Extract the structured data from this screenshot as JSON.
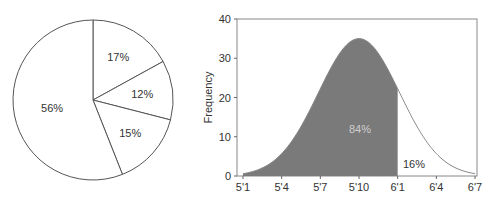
{
  "chart_data": [
    {
      "type": "pie",
      "title": "",
      "slices": [
        {
          "label": "17%",
          "value": 17
        },
        {
          "label": "12%",
          "value": 12
        },
        {
          "label": "15%",
          "value": 15
        },
        {
          "label": "56%",
          "value": 56
        }
      ],
      "colors": [
        "#ffffff"
      ],
      "stroke": "#555555"
    },
    {
      "type": "area",
      "title": "",
      "xlabel": "",
      "ylabel": "Frequency",
      "x_ticks": [
        "5'1",
        "5'4",
        "5'7",
        "5'10",
        "6'1",
        "6'4",
        "6'7"
      ],
      "y_ticks": [
        "0",
        "10",
        "20",
        "30",
        "40"
      ],
      "ylim": [
        0,
        40
      ],
      "distribution": "normal",
      "mean": "5'10",
      "peak": 35,
      "shaded_until": "6'1",
      "annotations": [
        {
          "text": "84%",
          "region": "shaded"
        },
        {
          "text": "16%",
          "region": "unshaded tail"
        }
      ],
      "fill_color": "#7a7a7a",
      "grid": false
    }
  ]
}
